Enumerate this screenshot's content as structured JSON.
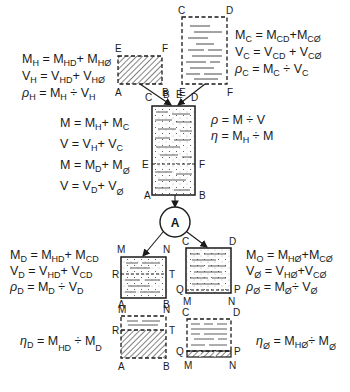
{
  "diagram": {
    "equations": {
      "hydrate": {
        "mass": [
          "M",
          "H",
          " = ",
          "M",
          "HD",
          "+",
          "M",
          "HØ"
        ],
        "volume": [
          "V",
          "H",
          " = ",
          "V",
          "HD",
          "+",
          "V",
          "HØ"
        ],
        "density": [
          "ρ",
          "H",
          " = ",
          "M",
          "H",
          "÷",
          "V",
          "H"
        ]
      },
      "crystal": {
        "mass": [
          "M",
          "C",
          " = ",
          "M",
          "CD",
          "+",
          "M",
          "CØ"
        ],
        "volume": [
          "V",
          "C",
          " = ",
          "V",
          "CD",
          "+",
          "V",
          "CØ"
        ],
        "density": [
          "ρ",
          "C",
          " = ",
          "M",
          "C",
          "÷",
          "V",
          "C"
        ]
      },
      "mixture_left": [
        [
          "M",
          "",
          " = ",
          "M",
          "H",
          "+",
          "M",
          "C"
        ],
        [
          "V",
          "",
          " = ",
          "V",
          "H",
          "+",
          "V",
          "C"
        ],
        [
          "M",
          "",
          " = ",
          "M",
          "D",
          "+",
          "M",
          "Ø"
        ],
        [
          "V",
          "",
          " = ",
          "V",
          "D",
          "+",
          "V",
          "Ø"
        ]
      ],
      "mixture_right": [
        [
          "ρ",
          "",
          " = ",
          "M",
          "",
          "÷",
          "V",
          ""
        ],
        [
          "η",
          "",
          " = ",
          "M",
          "H",
          "÷",
          "M",
          ""
        ]
      ],
      "dissolved": {
        "mass": [
          "M",
          "D",
          " = ",
          "M",
          "HD",
          "+",
          "M",
          "CD"
        ],
        "volume": [
          "V",
          "D",
          " = ",
          "V",
          "HD",
          "+",
          "V",
          "CD"
        ],
        "density": [
          "ρ",
          "D",
          " = ",
          "M",
          "D",
          "÷",
          "V",
          "D"
        ]
      },
      "undissolved": {
        "mass": [
          "M",
          "O",
          " = ",
          "M",
          "HØ",
          "+",
          "M",
          "CØ"
        ],
        "volume": [
          "V",
          "Ø",
          " = ",
          "V",
          "HØ",
          "+",
          "V",
          "CØ"
        ],
        "density": [
          "ρ",
          "Ø",
          " = ",
          "M",
          "Ø",
          "÷",
          "V",
          "Ø"
        ]
      },
      "eta_dissolved": [
        "η",
        "D",
        " = ",
        "M",
        "HD",
        "÷",
        "M",
        "D"
      ],
      "eta_undissolved": [
        "η",
        "Ø",
        " = ",
        "M",
        "HØ",
        "÷",
        "M",
        "Ø"
      ]
    },
    "labels": {
      "hydrate_box": {
        "tl": "E",
        "tr": "F",
        "bl": "A",
        "br": "B"
      },
      "crystal_box": {
        "tl": "C",
        "tr": "D",
        "bl": "E",
        "br": "F"
      },
      "arrow_labels": {
        "c": "C",
        "b": "B",
        "e": "E",
        "d": "D"
      },
      "mixture_box": {
        "top_right": "D",
        "mid_left": "E",
        "mid_right": "F",
        "bl": "A",
        "br": "B"
      },
      "circle": "A",
      "dissolved_box": {
        "tl": "M",
        "tr": "N",
        "ml": "R",
        "mr": "T",
        "bl": "A",
        "br": "B"
      },
      "undissolved_box": {
        "tl": "C",
        "tr": "D",
        "ml": "Q",
        "mr": "P",
        "bl": "M",
        "br": "N"
      },
      "dissolved_fraction_box": {
        "tl": "M",
        "tr": "N",
        "ml": "R",
        "mr": "T",
        "bl": "A",
        "br": "B"
      },
      "undissolved_fraction_box": {
        "tl": "C",
        "tr": "D",
        "ml": "Q",
        "mr": "P",
        "bl": "M",
        "br": "N",
        "top_m": "M",
        "top_n": "N"
      }
    },
    "colors": {
      "ink": "#1a1a1a",
      "background": "#ffffff"
    }
  }
}
